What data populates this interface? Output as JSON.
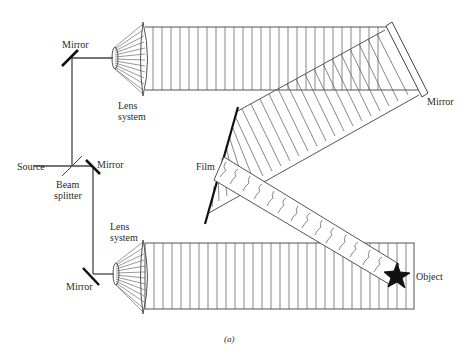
{
  "diagram": {
    "caption": "(a)",
    "labels": {
      "mirror_top_left": "Mirror",
      "lens_system_top_1": "Lens",
      "lens_system_top_2": "system",
      "source": "Source",
      "beam_splitter_1": "Beam",
      "beam_splitter_2": "splitter",
      "mirror_middle": "Mirror",
      "lens_system_bottom_1": "Lens",
      "lens_system_bottom_2": "system",
      "mirror_bottom_left": "Mirror",
      "mirror_right": "Mirror",
      "film": "Film",
      "object": "Object"
    },
    "components": [
      "Source",
      "Beam splitter",
      "Mirror",
      "Mirror",
      "Mirror",
      "Lens system",
      "Lens system",
      "Mirror",
      "Film",
      "Object"
    ],
    "colors": {
      "line": "#555555",
      "ink": "#111111",
      "background": "#ffffff"
    }
  }
}
